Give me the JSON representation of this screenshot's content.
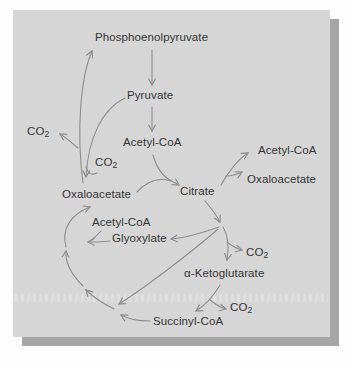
{
  "figure": {
    "type": "metabolic-pathway-diagram",
    "colors": {
      "panel_background": "#d6d6d6",
      "panel_shadow": "#a6a6a6",
      "page_background": "#fefefe",
      "arrow": "#8d8d8d",
      "text": "#343434"
    }
  },
  "labels": {
    "phosphoenolpyruvate": "Phosphoenolpyruvate",
    "pyruvate": "Pyruvate",
    "acetyl_coa": "Acetyl-CoA",
    "co2": {
      "main": "CO",
      "sub": "2"
    },
    "oxaloacetate": "Oxaloacetate",
    "citrate": "Citrate",
    "acetyl_coa_export": "Acetyl-CoA",
    "oxaloacetate_export": "Oxaloacetate",
    "acetyl_coa_glyoxylate": "Acetyl-CoA",
    "glyoxylate": "Glyoxylate",
    "alpha_ketoglutarate": "α-Ketoglutarate",
    "succinyl_coa": "Succinyl-CoA"
  },
  "reactions": [
    {
      "from": "Phosphoenolpyruvate",
      "to": "Pyruvate"
    },
    {
      "from": "Pyruvate",
      "to": "Acetyl-CoA"
    },
    {
      "from": "Acetyl-CoA",
      "to": "Citrate"
    },
    {
      "from": "Oxaloacetate",
      "to": "Citrate"
    },
    {
      "from": "Pyruvate",
      "to": "Oxaloacetate",
      "consumes": "CO2"
    },
    {
      "from": "Oxaloacetate",
      "to": "Phosphoenolpyruvate",
      "releases": "CO2"
    },
    {
      "from": "Citrate",
      "to": "Acetyl-CoA"
    },
    {
      "from": "Citrate",
      "to": "Oxaloacetate"
    },
    {
      "from": "Citrate",
      "to": "α-Ketoglutarate",
      "releases": "CO2"
    },
    {
      "from": "Isocitrate branch point",
      "to": "Glyoxylate"
    },
    {
      "from": "Isocitrate branch point",
      "to": "Succinate (cycle, lower left)"
    },
    {
      "from": "Glyoxylate + Acetyl-CoA",
      "to": "Malate (cycle, left arc)"
    },
    {
      "from": "α-Ketoglutarate",
      "to": "Succinyl-CoA",
      "releases": "CO2"
    },
    {
      "from": "Succinyl-CoA",
      "to": "Oxaloacetate",
      "via": "left arc of cycle"
    }
  ]
}
